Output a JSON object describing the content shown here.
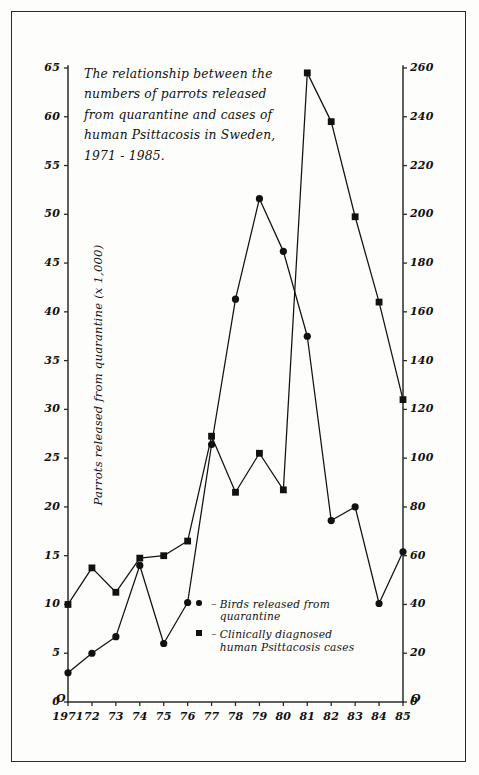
{
  "chart_data": {
    "type": "line",
    "title": "The relationship between the\nnumbers of parrots released\nfrom quarantine and cases of\nhuman Psittacosis in Sweden,\n1971 - 1985.",
    "xlabel": "",
    "ylabel": "Parrots released from quarantine (x 1,000)",
    "ylabel_right": "Human cases of Psittacosis",
    "grid": false,
    "legend_position": "inside-lower-right",
    "categories": [
      "1971",
      "72",
      "73",
      "74",
      "75",
      "76",
      "77",
      "78",
      "79",
      "80",
      "81",
      "82",
      "83",
      "84",
      "85"
    ],
    "x": [
      1971,
      1972,
      1973,
      1974,
      1975,
      1976,
      1977,
      1978,
      1979,
      1980,
      1981,
      1982,
      1983,
      1984,
      1985
    ],
    "ylim": [
      0,
      65
    ],
    "yticks": [
      0,
      5,
      10,
      15,
      20,
      25,
      30,
      35,
      40,
      45,
      50,
      55,
      60,
      65
    ],
    "ylim_right": [
      0,
      260
    ],
    "yticks_right": [
      0,
      20,
      40,
      60,
      80,
      100,
      120,
      140,
      160,
      180,
      200,
      220,
      240,
      260
    ],
    "series": [
      {
        "name": "Birds released from quarantine",
        "marker": "circle",
        "axis": "left",
        "units": "thousands",
        "values": [
          3.0,
          5.0,
          6.7,
          14.0,
          6.0,
          10.2,
          26.4,
          41.3,
          51.6,
          46.2,
          37.5,
          18.6,
          20.0,
          10.1,
          15.4
        ]
      },
      {
        "name": "Clinically diagnosed human Psittacosis cases",
        "marker": "square",
        "axis": "right",
        "units": "cases",
        "values": [
          40,
          55,
          45,
          59,
          60,
          66,
          109,
          86,
          102,
          87,
          258,
          238,
          199,
          164,
          124
        ]
      }
    ],
    "legend": [
      {
        "marker": "circle",
        "label": "Birds released from\nquarantine"
      },
      {
        "marker": "square",
        "label": "Clinically diagnosed\nhuman Psittacosis cases"
      }
    ],
    "colors": {
      "line": "#111111",
      "marker": "#111111",
      "axis": "#2a2a2a",
      "background": "#fdfdfb"
    }
  },
  "axes": {
    "left_ticks": [
      "65",
      "60",
      "55",
      "50",
      "45",
      "40",
      "35",
      "30",
      "25",
      "20",
      "15",
      "10",
      "5",
      "0"
    ],
    "right_ticks": [
      "260",
      "240",
      "220",
      "200",
      "180",
      "160",
      "140",
      "120",
      "100",
      "80",
      "60",
      "40",
      "20",
      "0"
    ],
    "x_ticks": [
      "1971",
      "72",
      "73",
      "74",
      "75",
      "76",
      "77",
      "78",
      "79",
      "80",
      "81",
      "82",
      "83",
      "84",
      "85"
    ],
    "left_title": "Parrots released from quarantine (x 1,000)",
    "right_title": "Human cases of Psittacosis",
    "origin_left_label": "O",
    "origin_right_label": "O"
  }
}
